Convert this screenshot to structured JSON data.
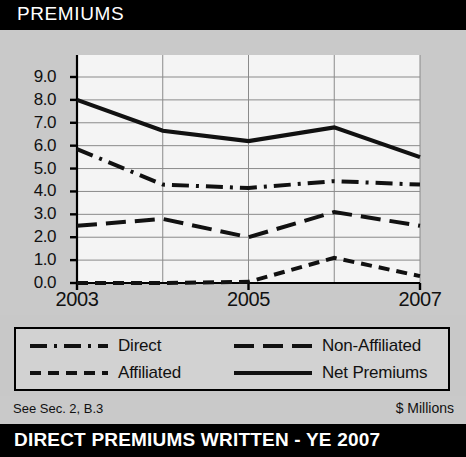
{
  "header": {
    "title": "PREMIUMS"
  },
  "footer": {
    "note": "See Sec. 2, B.3",
    "units": "$ Millions"
  },
  "bottom_bar": {
    "caption": "DIRECT PREMIUMS WRITTEN - YE 2007"
  },
  "chart_data": {
    "type": "line",
    "title": "PREMIUMS",
    "xlabel": "",
    "ylabel": "$ Millions",
    "x": [
      2003,
      2004,
      2005,
      2006,
      2007
    ],
    "tick_labels_x": [
      "2003",
      "2005",
      "2007"
    ],
    "tick_values_x": [
      2003,
      2005,
      2007
    ],
    "tick_labels_y": [
      "9.0",
      "8.0",
      "7.0",
      "6.0",
      "5.0",
      "4.0",
      "3.0",
      "2.0",
      "1.0",
      "0.0"
    ],
    "ylim": [
      0.0,
      9.0
    ],
    "xlim": [
      2003,
      2007
    ],
    "grid": true,
    "legend_position": "below",
    "series": [
      {
        "name": "Direct",
        "style": "dash-dot",
        "color": "#111111",
        "values": [
          5.85,
          4.3,
          4.15,
          4.45,
          4.3
        ]
      },
      {
        "name": "Affiliated",
        "style": "dashed",
        "color": "#111111",
        "values": [
          0.0,
          0.0,
          0.05,
          1.1,
          0.3
        ]
      },
      {
        "name": "Non-Affiliated",
        "style": "long-dash",
        "color": "#111111",
        "values": [
          2.5,
          2.8,
          2.0,
          3.1,
          2.5
        ]
      },
      {
        "name": "Net Premiums",
        "style": "solid",
        "color": "#111111",
        "values": [
          8.0,
          6.65,
          6.2,
          6.8,
          5.5
        ]
      }
    ]
  },
  "legend": {
    "items": [
      {
        "label": "Direct",
        "style": "dash-dot"
      },
      {
        "label": "Non-Affiliated",
        "style": "long-dash"
      },
      {
        "label": "Affiliated",
        "style": "dashed"
      },
      {
        "label": "Net Premiums",
        "style": "solid"
      }
    ]
  },
  "colors": {
    "title_bar": "#000000",
    "panel": "#c9c9c9",
    "plot_bg": "#f2f2f2",
    "ink": "#111111"
  }
}
